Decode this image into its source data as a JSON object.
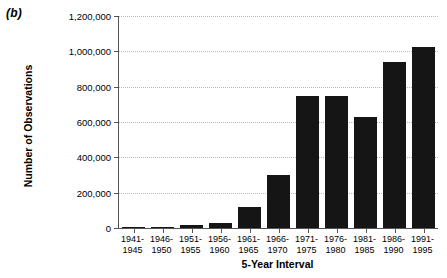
{
  "panel": {
    "label": "(b)"
  },
  "chart_data": {
    "type": "bar",
    "title": "",
    "xlabel": "5-Year Interval",
    "ylabel": "Number of Observations",
    "categories": [
      "1941-1945",
      "1946-1950",
      "1951-1955",
      "1956-1960",
      "1961-1965",
      "1966-1970",
      "1971-1975",
      "1976-1980",
      "1981-1985",
      "1986-1990",
      "1991-1995"
    ],
    "category_lines": [
      [
        "1941-",
        "1945"
      ],
      [
        "1946-",
        "1950"
      ],
      [
        "1951-",
        "1955"
      ],
      [
        "1956-",
        "1960"
      ],
      [
        "1961-",
        "1965"
      ],
      [
        "1966-",
        "1970"
      ],
      [
        "1971-",
        "1975"
      ],
      [
        "1976-",
        "1980"
      ],
      [
        "1981-",
        "1985"
      ],
      [
        "1986-",
        "1990"
      ],
      [
        "1991-",
        "1995"
      ]
    ],
    "values": [
      1000,
      8000,
      18000,
      28000,
      119000,
      300000,
      747000,
      745000,
      628000,
      940000,
      1024000
    ],
    "ylim": [
      0,
      1200000
    ],
    "yticks": [
      0,
      200000,
      400000,
      600000,
      800000,
      1000000,
      1200000
    ],
    "ytick_labels": [
      "0",
      "200,000",
      "400,000",
      "600,000",
      "800,000",
      "1,000,000",
      "1,200,000"
    ],
    "grid": true,
    "grid_axis": "y",
    "legend": "none",
    "bar_color": "#151515",
    "grid_color": "#b9b9b9",
    "axis_color": "#555555"
  }
}
